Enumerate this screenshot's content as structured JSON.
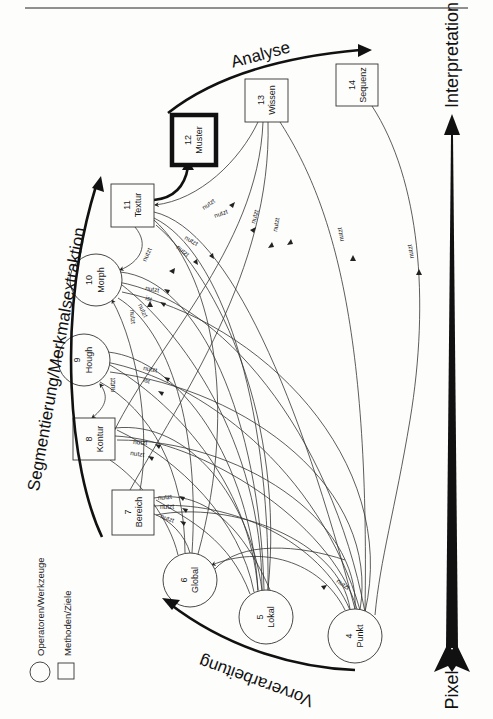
{
  "figure": {
    "orientation": "rotated 90 degrees clockwise",
    "nodes": [
      {
        "id": 4,
        "name": "Punkt",
        "shape": "circle",
        "cx": 355,
        "cy": 636,
        "r": 27
      },
      {
        "id": 5,
        "name": "Lokal",
        "shape": "circle",
        "cx": 266,
        "cy": 617,
        "r": 27
      },
      {
        "id": 6,
        "name": "Global",
        "shape": "circle",
        "cx": 190,
        "cy": 580,
        "r": 27
      },
      {
        "id": 7,
        "name": "Bereich",
        "shape": "box",
        "x": 112,
        "y": 490,
        "w": 42,
        "h": 45
      },
      {
        "id": 8,
        "name": "Kontur",
        "shape": "box",
        "x": 73,
        "y": 418,
        "w": 42,
        "h": 42
      },
      {
        "id": 9,
        "name": "Hough",
        "shape": "circle",
        "cx": 84,
        "cy": 360,
        "r": 26
      },
      {
        "id": 10,
        "name": "Morph",
        "shape": "circle",
        "cx": 96,
        "cy": 280,
        "r": 26
      },
      {
        "id": 11,
        "name": "Textur",
        "shape": "box",
        "x": 111,
        "y": 184,
        "w": 43,
        "h": 43
      },
      {
        "id": 12,
        "name": "Muster",
        "shape": "box-bold",
        "x": 172,
        "y": 115,
        "w": 44,
        "h": 50
      },
      {
        "id": 13,
        "name": "Wissen",
        "shape": "box",
        "x": 245,
        "y": 79,
        "w": 43,
        "h": 43
      },
      {
        "id": 14,
        "name": "Sequenz",
        "shape": "box",
        "x": 336,
        "y": 64,
        "w": 42,
        "h": 42
      }
    ],
    "edge_labels": {
      "uses": "nutzt",
      "is": "ist"
    },
    "phases": [
      {
        "name": "Vorverarbeitung"
      },
      {
        "name": "Segmentierung/Merkmalsextraktion"
      },
      {
        "name": "Analyse"
      }
    ],
    "axis": {
      "low": "Pixel",
      "high": "Interpretation"
    },
    "legend": [
      {
        "shape": "circle",
        "label": "Operatoren/Werkzeuge"
      },
      {
        "shape": "box",
        "label": "Methoden/Ziele"
      }
    ]
  }
}
